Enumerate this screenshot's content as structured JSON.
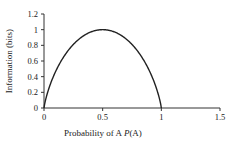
{
  "chart_data": {
    "type": "line",
    "title": "",
    "xlabel": "Probability of A P(A)",
    "xlabel_parts": [
      "Probability of A ",
      "P",
      "(A)"
    ],
    "ylabel": "Information (bits)",
    "xlim": [
      0,
      1.5
    ],
    "ylim": [
      0,
      1.2
    ],
    "xticks": [
      "0",
      "0.5",
      "1",
      "1.5"
    ],
    "xtick_values": [
      0,
      0.5,
      1,
      1.5
    ],
    "yticks": [
      "0",
      "0.2",
      "0.4",
      "0.6",
      "0.8",
      "1",
      "1.2"
    ],
    "ytick_values": [
      0,
      0.2,
      0.4,
      0.6,
      0.8,
      1,
      1.2
    ],
    "grid": false,
    "legend": null,
    "series": [
      {
        "name": "Binary entropy H(P(A))",
        "x": [
          0,
          0.05,
          0.1,
          0.15,
          0.2,
          0.25,
          0.3,
          0.35,
          0.4,
          0.45,
          0.5,
          0.55,
          0.6,
          0.65,
          0.7,
          0.75,
          0.8,
          0.85,
          0.9,
          0.95,
          1
        ],
        "values": [
          0,
          0.286,
          0.469,
          0.61,
          0.722,
          0.811,
          0.881,
          0.934,
          0.971,
          0.993,
          1,
          0.993,
          0.971,
          0.934,
          0.881,
          0.811,
          0.722,
          0.61,
          0.469,
          0.286,
          0
        ],
        "color": "#222222"
      }
    ]
  }
}
